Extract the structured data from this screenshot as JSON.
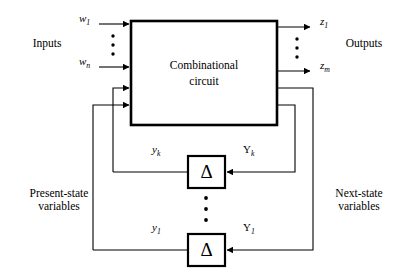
{
  "figure": {
    "type": "sequential-circuit-block-diagram",
    "background_color": "#ffffff",
    "line_color": "#000000"
  },
  "main_block": {
    "name": "combinational-circuit",
    "label_line1": "Combinational",
    "label_line2": "circuit"
  },
  "labels": {
    "inputs": "Inputs",
    "outputs": "Outputs",
    "present_state_line1": "Present-state",
    "present_state_line2": "variables",
    "next_state_line1": "Next-state",
    "next_state_line2": "variables"
  },
  "input_signals": [
    {
      "name": "w-1",
      "base": "w",
      "sub": "1"
    },
    {
      "name": "w-n",
      "base": "w",
      "sub": "n"
    }
  ],
  "output_signals": [
    {
      "name": "z-1",
      "base": "z",
      "sub": "1"
    },
    {
      "name": "z-m",
      "base": "z",
      "sub": "m"
    }
  ],
  "state_signals": {
    "present": [
      {
        "name": "y-k",
        "base": "y",
        "sub": "k"
      },
      {
        "name": "y-1",
        "base": "y",
        "sub": "1"
      }
    ],
    "next": [
      {
        "name": "Y-k",
        "base": "Y",
        "sub": "k"
      },
      {
        "name": "Y-1",
        "base": "Y",
        "sub": "1"
      }
    ]
  },
  "flip_flops": [
    {
      "name": "delay-element-k",
      "glyph": "Δ"
    },
    {
      "name": "delay-element-1",
      "glyph": "Δ"
    }
  ],
  "ellipses": [
    {
      "name": "input-ellipsis",
      "dots": 3
    },
    {
      "name": "output-ellipsis",
      "dots": 3
    },
    {
      "name": "delay-ellipsis",
      "dots": 3
    }
  ]
}
